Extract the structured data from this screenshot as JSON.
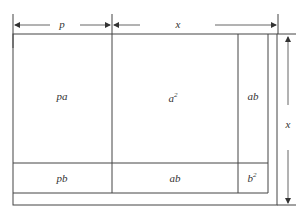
{
  "diagram": {
    "dimensions": {
      "top_left": "p",
      "top_right": "x",
      "right": "x"
    },
    "regions": {
      "pa": "pa",
      "a2_base": "a",
      "a2_exp": "2",
      "ab_right": "ab",
      "pb": "pb",
      "ab_bottom": "ab",
      "b2_base": "b",
      "b2_exp": "2"
    }
  }
}
